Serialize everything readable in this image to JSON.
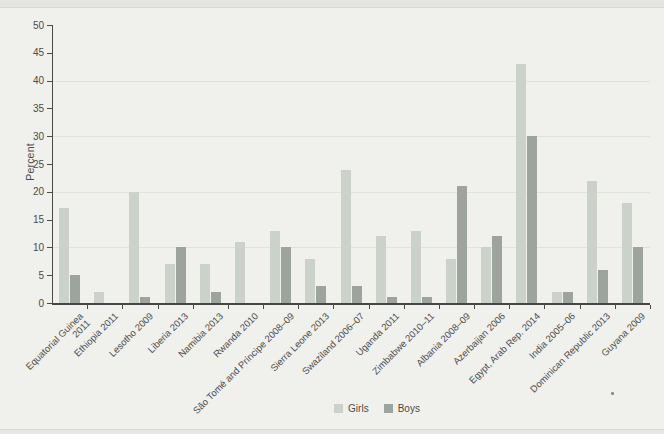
{
  "figure": {
    "ylabel": "Percent",
    "legend": {
      "girls_label": "Girls",
      "boys_label": "Boys"
    },
    "colors": {
      "girls": "#cbd2c9",
      "boys": "#9da49d",
      "axis": "#4a4a47",
      "background": "#f0f0ec",
      "gridline": "#e0e3da"
    }
  },
  "chart_data": {
    "type": "bar",
    "title": "",
    "xlabel": "",
    "ylabel": "Percent",
    "ylim": [
      0,
      50
    ],
    "ytick_step": 5,
    "yticks": [
      0,
      5,
      10,
      15,
      20,
      25,
      30,
      35,
      40,
      45,
      50
    ],
    "grid": "faint horizontal lines at 10, 20, 30, 40",
    "legend_position": "bottom-center",
    "categories": [
      "Equatorial Guinea 2011",
      "Ethiopia 2011",
      "Lesotho 2009",
      "Liberia 2013",
      "Namibia 2013",
      "Rwanda 2010",
      "São Tomé and Príncipe 2008–09",
      "Sierra Leone 2013",
      "Swaziland 2006–07",
      "Uganda 2011",
      "Zimbabwe 2010–11",
      "Albania 2008–09",
      "Azerbaijan 2006",
      "Egypt, Arab Rep. 2014",
      "India 2005–06",
      "Dominican Republic 2013",
      "Guyana 2009"
    ],
    "tick_label_lines": [
      [
        "Equatorial Guinea",
        "2011"
      ],
      [
        "Ethiopia 2011"
      ],
      [
        "Lesotho 2009"
      ],
      [
        "Liberia 2013"
      ],
      [
        "Namibia 2013"
      ],
      [
        "Rwanda 2010"
      ],
      [
        "São Tomé and Príncipe 2008–09"
      ],
      [
        "Sierra Leone 2013"
      ],
      [
        "Swaziland 2006–07"
      ],
      [
        "Uganda 2011"
      ],
      [
        "Zimbabwe 2010–11"
      ],
      [
        "Albania 2008–09"
      ],
      [
        "Azerbaijan 2006"
      ],
      [
        "Egypt, Arab Rep. 2014"
      ],
      [
        "India 2005–06"
      ],
      [
        "Dominican Republic 2013"
      ],
      [
        "Guyana 2009"
      ]
    ],
    "series": [
      {
        "name": "Girls",
        "color": "#cbd2c9",
        "values": [
          17,
          2,
          20,
          7,
          7,
          11,
          13,
          8,
          24,
          12,
          13,
          8,
          10,
          43,
          2,
          22,
          18
        ]
      },
      {
        "name": "Boys",
        "color": "#9da49d",
        "values": [
          5,
          0,
          1,
          10,
          2,
          0,
          10,
          3,
          3,
          1,
          1,
          21,
          12,
          30,
          2,
          6,
          10
        ]
      }
    ]
  }
}
